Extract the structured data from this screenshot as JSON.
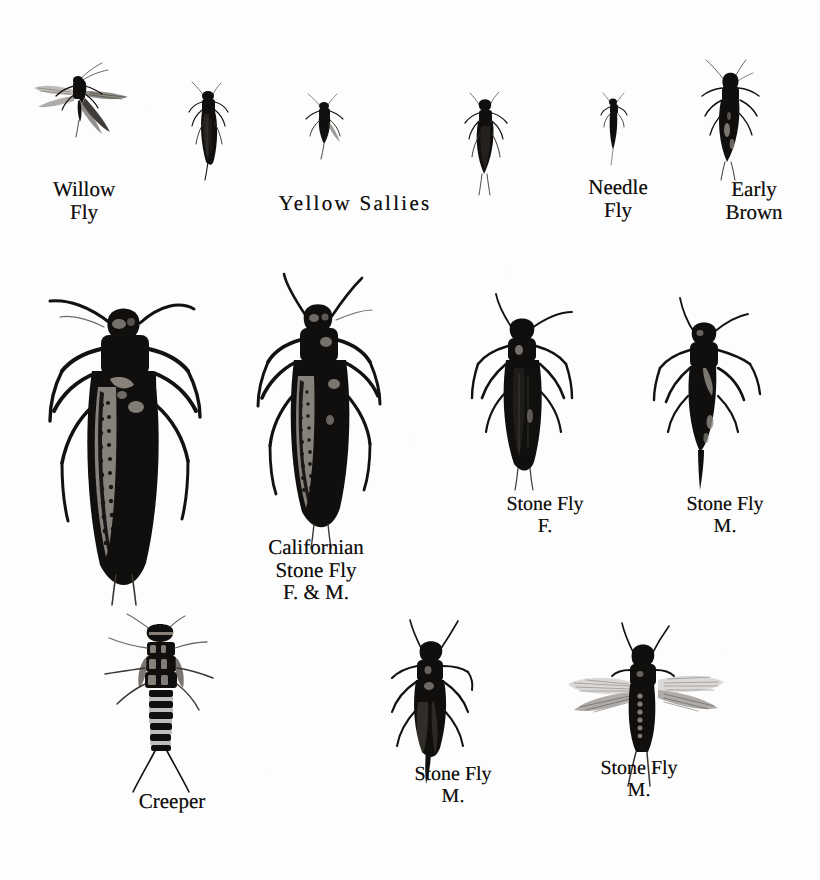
{
  "plate": {
    "background_color": "#fdfdfd",
    "ink_color": "#100f0d",
    "width": 820,
    "height": 880
  },
  "rows": [
    {
      "name": "top-row",
      "specimens": [
        {
          "id": "willow-fly",
          "icon": "stonefly-wings-spread-icon",
          "label": "Willow\nFly"
        },
        {
          "id": "yellow-sally-a",
          "icon": "stonefly-folded-icon",
          "label": ""
        },
        {
          "id": "yellow-sally-b",
          "icon": "stonefly-small-icon",
          "label": ""
        },
        {
          "id": "yellow-sally-c",
          "icon": "stonefly-folded-icon",
          "label": ""
        },
        {
          "id": "needle-fly",
          "icon": "stonefly-slender-icon",
          "label": "Needle\nFly"
        },
        {
          "id": "early-brown",
          "icon": "stonefly-legs-spread-icon",
          "label": "Early\nBrown"
        }
      ],
      "group_label": "Yellow  Sallies"
    },
    {
      "name": "middle-row",
      "specimens": [
        {
          "id": "californian-stone-fly-female",
          "icon": "large-stonefly-icon",
          "label": ""
        },
        {
          "id": "californian-stone-fly-male",
          "icon": "large-stonefly-icon",
          "label": ""
        },
        {
          "id": "stone-fly-female",
          "icon": "stonefly-folded-icon",
          "label": "Stone Fly\nF."
        },
        {
          "id": "stone-fly-male",
          "icon": "stonefly-tailed-icon",
          "label": "Stone Fly\nM."
        }
      ],
      "group_label": "Californian\nStone Fly\nF. & M."
    },
    {
      "name": "bottom-row",
      "specimens": [
        {
          "id": "creeper",
          "icon": "stonefly-nymph-icon",
          "label": "Creeper"
        },
        {
          "id": "stone-fly-male-2",
          "icon": "stonefly-folded-wings-icon",
          "label": "Stone Fly\nM."
        },
        {
          "id": "stone-fly-male-spread",
          "icon": "stonefly-wings-open-icon",
          "label": "Stone Fly\nM."
        }
      ]
    }
  ],
  "captions": {
    "willow_fly": "Willow\nFly",
    "yellow_sallies": "Yellow  Sallies",
    "needle_fly": "Needle\nFly",
    "early_brown": "Early\nBrown",
    "californian_stone_fly": "Californian\nStone Fly\nF. & M.",
    "stone_fly_f": "Stone Fly\nF.",
    "stone_fly_m_mid": "Stone Fly\nM.",
    "creeper": "Creeper",
    "stone_fly_m_bottom_mid": "Stone Fly\nM.",
    "stone_fly_m_bottom_right": "Stone Fly\nM."
  }
}
